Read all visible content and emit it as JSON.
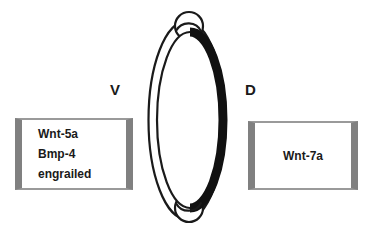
{
  "figure": {
    "background_color": "#ffffff"
  },
  "axis_labels": {
    "ventral": "V",
    "dorsal": "D"
  },
  "ventral_box": {
    "genes": [
      "Wnt-5a",
      "Bmp-4",
      "engrailed"
    ],
    "border_color": "#808080",
    "fill_color": "#ffffff"
  },
  "dorsal_box": {
    "genes": [
      "Wnt-7a"
    ],
    "border_color": "#808080",
    "fill_color": "#ffffff"
  },
  "limb_bud": {
    "outer_outline_color": "#1a1a1a",
    "inner_outline_color": "#1a1a1a",
    "dorsal_ectoderm_color": "#111111",
    "aer_top_label": "apical-ectodermal-ridge-top",
    "aer_bottom_label": "apical-ectodermal-ridge-bottom"
  }
}
